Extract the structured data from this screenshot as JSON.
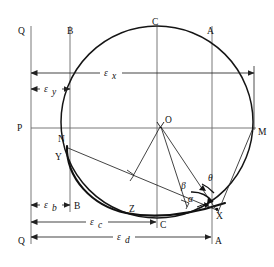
{
  "figure": {
    "background_color": "#ffffff",
    "line_color": "#1a1a1a",
    "thin_line_color": "#555555"
  },
  "points": [
    {
      "id": "Q_top",
      "label": "Q",
      "x": 22,
      "y": 31
    },
    {
      "id": "B_top",
      "label": "B",
      "x": 72,
      "y": 31
    },
    {
      "id": "C_top",
      "label": "C",
      "x": 157,
      "y": 22
    },
    {
      "id": "A_top",
      "label": "A",
      "x": 212,
      "y": 31
    },
    {
      "id": "P_left",
      "label": "P",
      "x": 22,
      "y": 128
    },
    {
      "id": "M_right",
      "label": "M",
      "x": 258,
      "y": 132
    },
    {
      "id": "N",
      "label": "N",
      "x": 64,
      "y": 139
    },
    {
      "id": "O",
      "label": "O",
      "x": 167,
      "y": 122
    },
    {
      "id": "Y",
      "label": "Y",
      "x": 60,
      "y": 157
    },
    {
      "id": "Z",
      "label": "Z",
      "x": 133,
      "y": 209
    },
    {
      "id": "X",
      "label": "X",
      "x": 219,
      "y": 214
    },
    {
      "id": "B_bottom",
      "label": "B",
      "x": 76,
      "y": 208
    },
    {
      "id": "C_bottom",
      "label": "C",
      "x": 161,
      "y": 228
    },
    {
      "id": "Q_bottom",
      "label": "Q",
      "x": 22,
      "y": 242
    },
    {
      "id": "A_bottom",
      "label": "A",
      "x": 216,
      "y": 242
    }
  ],
  "angles": [
    {
      "id": "alpha",
      "label": "α",
      "x": 191,
      "y": 199,
      "vertex": "X"
    },
    {
      "id": "beta",
      "label": "β",
      "x": 184,
      "y": 186,
      "vertex": "X"
    },
    {
      "id": "theta",
      "label": "θ",
      "x": 211,
      "y": 178,
      "vertex": "X"
    }
  ],
  "dimensions": [
    {
      "id": "eps_x",
      "symbol": "ε",
      "subscript": "x",
      "label_x": 108,
      "label_y": 76,
      "y": 73,
      "x1": 31,
      "x2": 254,
      "caps": "both"
    },
    {
      "id": "eps_y",
      "symbol": "ε",
      "subscript": "y",
      "label_x": 46,
      "label_y": 92,
      "y": 89,
      "x1": 31,
      "x2": 70,
      "caps": "both"
    },
    {
      "id": "eps_b",
      "symbol": "ε",
      "subscript": "b",
      "label_x": 45,
      "label_y": 208,
      "y": 205,
      "x1": 31,
      "x2": 70,
      "caps": "both"
    },
    {
      "id": "eps_c",
      "symbol": "ε",
      "subscript": "c",
      "label_x": 93,
      "label_y": 225,
      "y": 222,
      "x1": 31,
      "x2": 156,
      "caps": "both"
    },
    {
      "id": "eps_d",
      "symbol": "ε",
      "subscript": "d",
      "label_x": 120,
      "label_y": 240,
      "y": 237,
      "x1": 31,
      "x2": 212,
      "caps": "both"
    }
  ],
  "vertical_lines": [
    {
      "id": "line-Q",
      "x": 31,
      "y1": 26,
      "y2": 244
    },
    {
      "id": "line-B",
      "x": 70,
      "y1": 26,
      "y2": 212
    },
    {
      "id": "line-C",
      "x": 157,
      "y1": 26,
      "y2": 226
    },
    {
      "id": "line-A",
      "x": 212,
      "y1": 26,
      "y2": 244
    }
  ],
  "horizontal_lines": [
    {
      "id": "line-PM",
      "y": 128,
      "x1": 31,
      "x2": 256
    }
  ],
  "circle": {
    "id": "main-circle",
    "cx": 157,
    "cy": 122,
    "r": 96
  },
  "ellipse_arc": {
    "id": "tangent-ellipse-arc",
    "through": [
      "Y",
      "Z",
      "X"
    ]
  },
  "right_angles": [
    {
      "id": "right-angle-1",
      "x": 131,
      "y": 174
    },
    {
      "id": "right-angle-2",
      "x": 184,
      "y": 203
    }
  ],
  "chords": [
    {
      "id": "chord-YX",
      "from": "Y",
      "to": "X"
    },
    {
      "id": "chord-O-perp1",
      "from": "O",
      "to": "right-angle-1"
    },
    {
      "id": "chord-O-perp2",
      "from": "O",
      "to": "right-angle-2"
    },
    {
      "id": "chord-OX",
      "from": "O",
      "to": "X"
    },
    {
      "id": "chord-MX",
      "from": "M",
      "to": "X"
    }
  ]
}
